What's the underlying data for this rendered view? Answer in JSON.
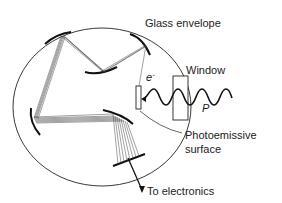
{
  "diagram": {
    "labels": {
      "glass_envelope": "Glass envelope",
      "window": "Window",
      "electron": "e",
      "electron_sup": "-",
      "photon": "P",
      "photoemissive_line1": "Photoemissive",
      "photoemissive_line2": "surface",
      "to_electronics": "To electronics"
    },
    "components": [
      {
        "name": "glass-envelope",
        "shape": "circle"
      },
      {
        "name": "window",
        "shape": "rectangle"
      },
      {
        "name": "photoemissive-surface",
        "shape": "rectangle"
      },
      {
        "name": "dynode",
        "count": 5
      },
      {
        "name": "anode",
        "shape": "bar"
      },
      {
        "name": "incident-light-wave",
        "shape": "sine"
      }
    ],
    "colors": {
      "ink": "#1a1a1a",
      "background": "#ffffff"
    }
  }
}
